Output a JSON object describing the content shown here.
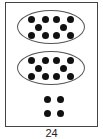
{
  "figure": {
    "caption": "24",
    "groups": [
      {
        "type": "ten-frame-oval",
        "count": 10
      },
      {
        "type": "ten-frame-oval",
        "count": 10
      },
      {
        "type": "loose-dots",
        "count": 4
      }
    ],
    "total": 24,
    "dot_color": "#111111",
    "border_color": "#444444"
  }
}
